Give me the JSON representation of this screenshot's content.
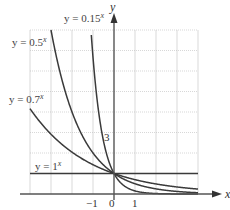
{
  "chart_data": {
    "type": "line",
    "title": "",
    "xlabel": "x",
    "ylabel": "y",
    "xlim": [
      -4,
      4
    ],
    "ylim": [
      0,
      8
    ],
    "grid": true,
    "x_tick_labels": [
      "-1",
      "0",
      "1"
    ],
    "y_tick_labels": [
      "3"
    ],
    "series": [
      {
        "name": "y = 0.15^x",
        "base": 0.15,
        "label_text": "y = 0.15",
        "label_exp": "x"
      },
      {
        "name": "y = 0.5^x",
        "base": 0.5,
        "label_text": "y = 0.5",
        "label_exp": "x"
      },
      {
        "name": "y = 0.7^x",
        "base": 0.7,
        "label_text": "y = 0.7",
        "label_exp": "x"
      },
      {
        "name": "y = 1^x",
        "base": 1,
        "label_text": "y = 1",
        "label_exp": "x"
      }
    ],
    "legend_position": "inline labels"
  },
  "axes": {
    "x_label": "x",
    "y_label": "y",
    "ticks": {
      "neg1": "−1",
      "zero": "0",
      "one": "1",
      "three": "3"
    }
  }
}
